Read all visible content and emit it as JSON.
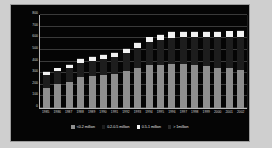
{
  "chart_data": {
    "type": "bar",
    "title": "",
    "subtitle": "",
    "xlabel": "",
    "ylabel": "",
    "stacked": true,
    "grid": true,
    "legend_position": "bottom",
    "ylim": [
      0,
      800
    ],
    "yticks": [
      800,
      700,
      600,
      500,
      400,
      300,
      200,
      100,
      0
    ],
    "categories": [
      "1985",
      "1986",
      "1987",
      "1988",
      "1989",
      "1990",
      "1991",
      "1992",
      "1993",
      "1994",
      "1995",
      "1996",
      "1997",
      "1998",
      "1999",
      "2000",
      "2001",
      "2002"
    ],
    "series": [
      {
        "name": "<0.2 million",
        "color": "#8f8f8f",
        "values": [
          170,
          205,
          222,
          268,
          272,
          280,
          295,
          315,
          340,
          372,
          372,
          378,
          378,
          372,
          362,
          345,
          342,
          325
        ]
      },
      {
        "name": "0.2-0.5 million",
        "color": "#1d1d1d",
        "values": [
          115,
          110,
          120,
          122,
          135,
          145,
          145,
          160,
          180,
          195,
          215,
          228,
          230,
          238,
          248,
          268,
          272,
          290
        ]
      },
      {
        "name": "0.5-1 million",
        "color": "#f2f2f2",
        "values": [
          25,
          28,
          28,
          32,
          32,
          33,
          33,
          35,
          38,
          40,
          42,
          45,
          45,
          45,
          45,
          45,
          45,
          45
        ]
      },
      {
        "name": "> 1million",
        "color": "#2a2a2a",
        "values": [
          5,
          5,
          5,
          6,
          6,
          6,
          6,
          7,
          7,
          8,
          8,
          8,
          8,
          8,
          8,
          8,
          8,
          8
        ]
      }
    ],
    "totals": [
      315,
      348,
      375,
      428,
      445,
      464,
      479,
      517,
      565,
      615,
      637,
      659,
      661,
      663,
      663,
      666,
      667,
      668
    ]
  },
  "legend": {
    "items": [
      {
        "label": "<0.2 million",
        "color": "#8f8f8f"
      },
      {
        "label": "0.2-0.5 million",
        "color": "#1d1d1d"
      },
      {
        "label": "0.5-1 million",
        "color": "#f2f2f2"
      },
      {
        "label": "> 1million",
        "color": "#2a2a2a"
      }
    ]
  }
}
